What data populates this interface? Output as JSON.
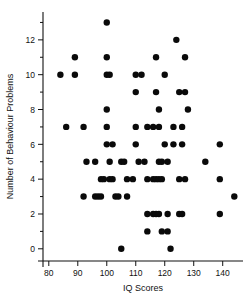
{
  "chart_data": {
    "type": "scatter",
    "title": "",
    "xlabel": "IQ Scores",
    "ylabel": "Number of Behaviour Problems",
    "xlim": [
      78,
      147
    ],
    "ylim": [
      -0.7,
      13.6
    ],
    "xticks": [
      80,
      90,
      100,
      110,
      120,
      130,
      140
    ],
    "yticks": [
      0,
      2,
      4,
      6,
      8,
      10,
      12
    ],
    "yminorticks": [
      1,
      3,
      5,
      7,
      9,
      11,
      13
    ],
    "xticklabels": [
      "80",
      "90",
      "100",
      "110",
      "120",
      "130",
      "140"
    ],
    "yticklabels": [
      "0",
      "2",
      "4",
      "6",
      "8",
      "10",
      "12"
    ],
    "grid": false,
    "legend": null,
    "marker": "circle",
    "marker_color": "#0a0a0a",
    "marker_size": 3.2,
    "points": [
      [
        100,
        13
      ],
      [
        124,
        12
      ],
      [
        89,
        11
      ],
      [
        100,
        11
      ],
      [
        117,
        11
      ],
      [
        127,
        11
      ],
      [
        84,
        10
      ],
      [
        89,
        10
      ],
      [
        100,
        10
      ],
      [
        101,
        10
      ],
      [
        110,
        10
      ],
      [
        112,
        10
      ],
      [
        120,
        10
      ],
      [
        110,
        9
      ],
      [
        117,
        9
      ],
      [
        125,
        9
      ],
      [
        127,
        9
      ],
      [
        100,
        8
      ],
      [
        118,
        8
      ],
      [
        128,
        8
      ],
      [
        86,
        7
      ],
      [
        92,
        7
      ],
      [
        100,
        7
      ],
      [
        110,
        7
      ],
      [
        114,
        7
      ],
      [
        116,
        7
      ],
      [
        118,
        7
      ],
      [
        123,
        7
      ],
      [
        126,
        7
      ],
      [
        100,
        6
      ],
      [
        102,
        6
      ],
      [
        110,
        6
      ],
      [
        120,
        6
      ],
      [
        123,
        6
      ],
      [
        126,
        6
      ],
      [
        139,
        6
      ],
      [
        93,
        5
      ],
      [
        96,
        5
      ],
      [
        101,
        5
      ],
      [
        105,
        5
      ],
      [
        106,
        5
      ],
      [
        111,
        5
      ],
      [
        113,
        5
      ],
      [
        118,
        5
      ],
      [
        119,
        5
      ],
      [
        121,
        5
      ],
      [
        134,
        5
      ],
      [
        98,
        4
      ],
      [
        99,
        4
      ],
      [
        101,
        4
      ],
      [
        102,
        4
      ],
      [
        107,
        4
      ],
      [
        109,
        4
      ],
      [
        114,
        4
      ],
      [
        116,
        4
      ],
      [
        117,
        4
      ],
      [
        118,
        4
      ],
      [
        119,
        4
      ],
      [
        125,
        4
      ],
      [
        127,
        4
      ],
      [
        139,
        4
      ],
      [
        92,
        3
      ],
      [
        96,
        3
      ],
      [
        97,
        3
      ],
      [
        98,
        3
      ],
      [
        103,
        3
      ],
      [
        104,
        3
      ],
      [
        107,
        3
      ],
      [
        144,
        3
      ],
      [
        114,
        2
      ],
      [
        116,
        2
      ],
      [
        117,
        2
      ],
      [
        118,
        2
      ],
      [
        121,
        2
      ],
      [
        125,
        2
      ],
      [
        126,
        2
      ],
      [
        139,
        2
      ],
      [
        114,
        1
      ],
      [
        119,
        1
      ],
      [
        121,
        1
      ],
      [
        105,
        0
      ],
      [
        122,
        0
      ]
    ]
  },
  "axes": {
    "x_axis_name": "x-axis",
    "y_axis_name": "y-axis"
  }
}
